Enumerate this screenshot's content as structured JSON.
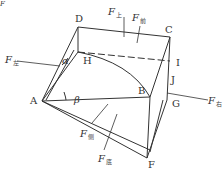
{
  "diagram": {
    "points": {
      "A": {
        "label": "A",
        "x": 42,
        "y": 101
      },
      "B": {
        "label": "B",
        "x": 150,
        "y": 97
      },
      "C": {
        "label": "C",
        "x": 170,
        "y": 37
      },
      "D": {
        "label": "D",
        "x": 78,
        "y": 27
      },
      "F": {
        "label": "F",
        "x": 147,
        "y": 158
      },
      "G": {
        "label": "G",
        "x": 167,
        "y": 100
      },
      "H": {
        "label": "H",
        "x": 78,
        "y": 52
      },
      "I": {
        "label": "I",
        "x": 170,
        "y": 61
      },
      "J": {
        "label": "J",
        "x": 168,
        "y": 80
      }
    },
    "angles": {
      "alpha": "α",
      "beta": "β"
    },
    "forces": [
      {
        "id": "top",
        "symbol": "F",
        "subscript": "上"
      },
      {
        "id": "front",
        "symbol": "F",
        "subscript": "前"
      },
      {
        "id": "left",
        "symbol": "F",
        "subscript": "左"
      },
      {
        "id": "right",
        "symbol": "F",
        "subscript": "右"
      },
      {
        "id": "side",
        "symbol": "F",
        "subscript": "侧"
      },
      {
        "id": "bottom",
        "symbol": "F",
        "subscript": "底"
      }
    ],
    "corner_mark": "F"
  }
}
